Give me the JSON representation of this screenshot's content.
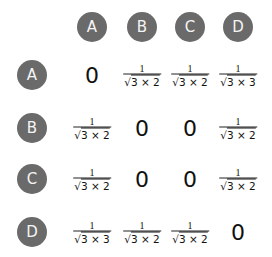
{
  "columns": [
    {
      "label": "A",
      "x": 92
    },
    {
      "label": "B",
      "x": 142
    },
    {
      "label": "C",
      "x": 190
    },
    {
      "label": "D",
      "x": 238
    }
  ],
  "header_y": 27,
  "rows": [
    {
      "label": "A",
      "y": 75,
      "cells": [
        {
          "type": "zero",
          "text": "0"
        },
        {
          "type": "frac",
          "num": "1",
          "den_root": "√",
          "den": "3 × 2"
        },
        {
          "type": "frac",
          "num": "1",
          "den_root": "√",
          "den": "3 × 2"
        },
        {
          "type": "frac",
          "num": "1",
          "den_root": "√",
          "den": "3 × 3"
        }
      ]
    },
    {
      "label": "B",
      "y": 128,
      "cells": [
        {
          "type": "frac",
          "num": "1",
          "den_root": "√",
          "den": "3 × 2"
        },
        {
          "type": "zero",
          "text": "0"
        },
        {
          "type": "zero",
          "text": "0"
        },
        {
          "type": "frac",
          "num": "1",
          "den_root": "√",
          "den": "3 × 2"
        }
      ]
    },
    {
      "label": "C",
      "y": 179,
      "cells": [
        {
          "type": "frac",
          "num": "1",
          "den_root": "√",
          "den": "3 × 2"
        },
        {
          "type": "zero",
          "text": "0"
        },
        {
          "type": "zero",
          "text": "0"
        },
        {
          "type": "frac",
          "num": "1",
          "den_root": "√",
          "den": "3 × 2"
        }
      ]
    },
    {
      "label": "D",
      "y": 232,
      "cells": [
        {
          "type": "frac",
          "num": "1",
          "den_root": "√",
          "den": "3 × 3"
        },
        {
          "type": "frac",
          "num": "1",
          "den_root": "√",
          "den": "3 × 2"
        },
        {
          "type": "frac",
          "num": "1",
          "den_root": "√",
          "den": "3 × 2"
        },
        {
          "type": "zero",
          "text": "0"
        }
      ]
    }
  ],
  "row_header_x": 32,
  "colors": {
    "circle": "#6a6a6a",
    "circle_text": "#f4f4f4",
    "text": "#111111"
  }
}
